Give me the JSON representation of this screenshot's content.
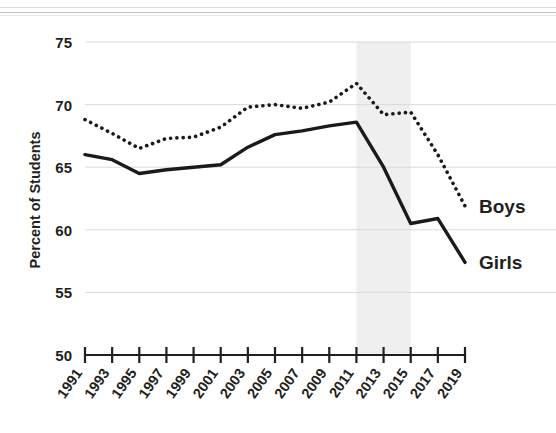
{
  "chart_data": {
    "type": "line",
    "title": "",
    "xlabel": "",
    "ylabel": "Percent of Students",
    "x": [
      1991,
      1993,
      1995,
      1997,
      1999,
      2001,
      2003,
      2005,
      2007,
      2009,
      2011,
      2013,
      2015,
      2017,
      2019
    ],
    "xtick_labels": [
      "1991",
      "1993",
      "1995",
      "1997",
      "1999",
      "2001",
      "2003",
      "2005",
      "2007",
      "2009",
      "2011",
      "2013",
      "2015",
      "2017",
      "2019"
    ],
    "ytick_labels": [
      "50",
      "55",
      "60",
      "65",
      "70",
      "75"
    ],
    "yticks": [
      50,
      55,
      60,
      65,
      70,
      75
    ],
    "ylim": [
      50,
      75
    ],
    "xlim": [
      1991,
      2019
    ],
    "grid": "horizontal",
    "legend_position": "right-inline",
    "series": [
      {
        "name": "Boys",
        "style": "dotted",
        "color": "#1a1a1a",
        "values": [
          68.8,
          67.7,
          66.5,
          67.3,
          67.4,
          68.2,
          69.8,
          70.0,
          69.7,
          70.2,
          71.7,
          69.2,
          69.4,
          66.0,
          61.9
        ]
      },
      {
        "name": "Girls",
        "style": "solid",
        "color": "#1a1a1a",
        "values": [
          66.0,
          65.6,
          64.5,
          64.8,
          65.0,
          65.2,
          66.6,
          67.6,
          67.9,
          68.3,
          68.6,
          65.0,
          60.5,
          60.9,
          57.4
        ]
      }
    ],
    "shaded_region": {
      "x_start": 2011,
      "x_end": 2015,
      "color": "#efefef"
    },
    "annotations": [
      {
        "text": "Boys",
        "x": 2019,
        "y": 61.9
      },
      {
        "text": "Girls",
        "x": 2019,
        "y": 57.4
      }
    ]
  },
  "legend": {
    "boys_label": "Boys",
    "girls_label": "Girls"
  },
  "axes": {
    "y_axis_title": "Percent of Students"
  }
}
